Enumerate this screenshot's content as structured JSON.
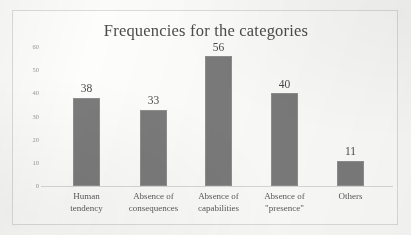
{
  "chart_data": {
    "type": "bar",
    "title": "Frequencies for the categories",
    "xlabel": "",
    "ylabel": "",
    "categories": [
      "Human tendency",
      "Absence of consequences",
      "Absence of capabilities",
      "Absence of \"presence\"",
      "Others"
    ],
    "category_lines": [
      [
        "Human",
        "tendency"
      ],
      [
        "Absence of",
        "consequences"
      ],
      [
        "Absence of",
        "capabilities"
      ],
      [
        "Absence of",
        "\"presence\""
      ],
      [
        "Others",
        ""
      ]
    ],
    "values": [
      38,
      33,
      56,
      40,
      11
    ],
    "value_labels": [
      "38",
      "33",
      "56",
      "40",
      "11"
    ],
    "ylim": [
      0,
      60
    ],
    "y_ticks": [
      0,
      10,
      20,
      30,
      40,
      50,
      60
    ],
    "y_tick_labels": [
      "0",
      "10",
      "20",
      "30",
      "40",
      "50",
      "60"
    ],
    "grid": false,
    "legend": false,
    "legend_position": "none",
    "bar_color": "#7b7b7b",
    "bar_border_color": "#8f8f8f",
    "frame_color": "#dcdcdc",
    "axis_color": "#d9d9d9",
    "title_color": "#4c4c4c",
    "tick_label_color": "#9a9a9a",
    "category_label_color": "#5a5a5a",
    "value_label_color": "#4a4a4a",
    "background_color": "#fdfdfc"
  }
}
